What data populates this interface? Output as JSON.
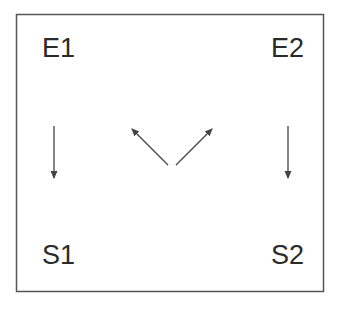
{
  "diagram": {
    "frame": {
      "x": 16,
      "y": 14,
      "width": 307,
      "height": 277,
      "stroke": "#555555"
    },
    "colors": {
      "text": "#2a2a2a",
      "arrow": "#444444"
    },
    "nodes": [
      {
        "id": "E1",
        "label": "E1",
        "x": 42,
        "y": 57
      },
      {
        "id": "E2",
        "label": "E2",
        "x": 271,
        "y": 57
      },
      {
        "id": "S1",
        "label": "S1",
        "x": 42,
        "y": 264
      },
      {
        "id": "S2",
        "label": "S2",
        "x": 271,
        "y": 264
      }
    ],
    "arrows": [
      {
        "id": "E1-to-S1",
        "direction": "down",
        "x1": 54,
        "y1": 126,
        "x2": 54,
        "y2": 178
      },
      {
        "id": "center-to-E1",
        "direction": "up-left",
        "x1": 168,
        "y1": 165,
        "x2": 132,
        "y2": 129
      },
      {
        "id": "center-to-E2",
        "direction": "up-right",
        "x1": 176,
        "y1": 165,
        "x2": 212,
        "y2": 129
      },
      {
        "id": "E2-to-S2",
        "direction": "down",
        "x1": 288,
        "y1": 126,
        "x2": 288,
        "y2": 178
      }
    ]
  }
}
